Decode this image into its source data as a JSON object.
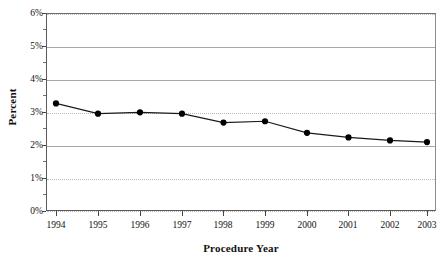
{
  "chart_data": {
    "type": "line",
    "title": "",
    "xlabel": "Procedure Year",
    "ylabel": "Percent",
    "categories": [
      "1994",
      "1995",
      "1996",
      "1997",
      "1998",
      "1999",
      "2000",
      "2001",
      "2002",
      "2003"
    ],
    "values": [
      3.26,
      2.95,
      2.99,
      2.95,
      2.68,
      2.72,
      2.37,
      2.23,
      2.14,
      2.09
    ],
    "series": [
      {
        "name": "Percent",
        "values": [
          3.26,
          2.95,
          2.99,
          2.95,
          2.68,
          2.72,
          2.37,
          2.23,
          2.14,
          2.09
        ]
      }
    ],
    "ylim": [
      0,
      6
    ],
    "xlim_categories": [
      "1994",
      "2003"
    ],
    "ytick_labels": [
      "0%",
      "1%",
      "2%",
      "3%",
      "4%",
      "5%",
      "6%"
    ],
    "ytick_values": [
      0,
      1,
      2,
      3,
      4,
      5,
      6
    ],
    "grid": "horizontal-dotted",
    "legend": "none",
    "marker": "filled-circle",
    "line_color": "#1a1a1a",
    "marker_color": "#000000",
    "grid_color": "#b9b9b9",
    "axis_color": "#4a4a4a",
    "background_color": "#ffffff"
  },
  "axes": {
    "y_title": "Percent",
    "x_title": "Procedure Year",
    "y_ticks": [
      {
        "label": "6%",
        "value": 6
      },
      {
        "label": "5%",
        "value": 5
      },
      {
        "label": "4%",
        "value": 4
      },
      {
        "label": "3%",
        "value": 3
      },
      {
        "label": "2%",
        "value": 2
      },
      {
        "label": "1%",
        "value": 1
      },
      {
        "label": "0%",
        "value": 0
      }
    ],
    "x_ticks": [
      {
        "label": "1994"
      },
      {
        "label": "1995"
      },
      {
        "label": "1996"
      },
      {
        "label": "1997"
      },
      {
        "label": "1998"
      },
      {
        "label": "1999"
      },
      {
        "label": "2000"
      },
      {
        "label": "2001"
      },
      {
        "label": "2002"
      },
      {
        "label": "2003"
      }
    ]
  }
}
